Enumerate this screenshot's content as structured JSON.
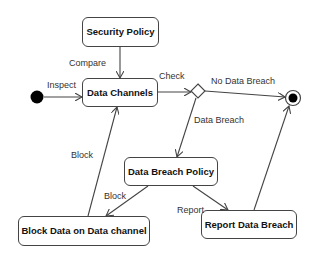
{
  "diagram": {
    "type": "UML activity diagram",
    "nodes": {
      "initial": {
        "kind": "initial-node"
      },
      "security_policy": {
        "label": "Security Policy"
      },
      "data_channels": {
        "label": "Data Channels"
      },
      "decision": {
        "kind": "decision-node"
      },
      "final": {
        "kind": "final-node"
      },
      "data_breach_policy": {
        "label": "Data Breach Policy"
      },
      "block_data": {
        "label": "Block Data on Data channel"
      },
      "report_breach": {
        "label": "Report Data Breach"
      }
    },
    "edges": {
      "inspect": {
        "from": "initial",
        "to": "data_channels",
        "label": "Inspect"
      },
      "compare": {
        "from": "security_policy",
        "to": "data_channels",
        "label": "Compare"
      },
      "check": {
        "from": "data_channels",
        "to": "decision",
        "label": "Check"
      },
      "no_breach": {
        "from": "decision",
        "to": "final",
        "label": "No Data Breach"
      },
      "breach": {
        "from": "decision",
        "to": "data_breach_policy",
        "label": "Data Breach"
      },
      "block_policy": {
        "from": "data_breach_policy",
        "to": "block_data",
        "label": "Block"
      },
      "report": {
        "from": "data_breach_policy",
        "to": "report_breach",
        "label": "Report"
      },
      "block_back": {
        "from": "block_data",
        "to": "data_channels",
        "label": "Block"
      },
      "report_final": {
        "from": "report_breach",
        "to": "final",
        "label": ""
      }
    }
  }
}
